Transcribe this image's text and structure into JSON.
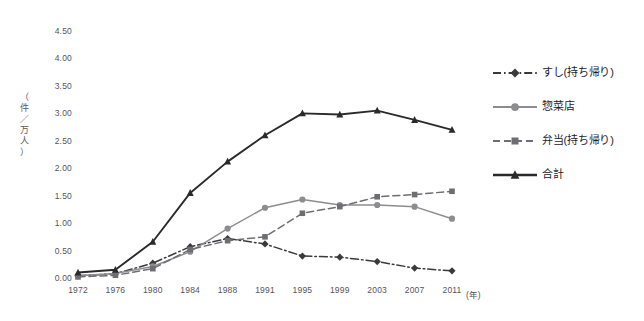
{
  "chart_data": {
    "type": "line",
    "title": "",
    "subtitle": "",
    "xlabel": "(年)",
    "ylabel": "（件／万人）",
    "ylabel_chars": [
      "（",
      "件",
      "／",
      "万",
      "人",
      "）"
    ],
    "categories": [
      "1972",
      "1976",
      "1980",
      "1984",
      "1988",
      "1991",
      "1995",
      "1999",
      "2003",
      "2007",
      "2011"
    ],
    "x": [
      1972,
      1976,
      1980,
      1984,
      1988,
      1991,
      1995,
      1999,
      2003,
      2007,
      2011
    ],
    "ylim": [
      0.0,
      4.5
    ],
    "ytick_labels": [
      "0.00",
      "0.50",
      "1.00",
      "1.50",
      "2.00",
      "2.50",
      "3.00",
      "3.50",
      "4.00",
      "4.50"
    ],
    "ytick_values": [
      0.0,
      0.5,
      1.0,
      1.5,
      2.0,
      2.5,
      3.0,
      3.5,
      4.0,
      4.5
    ],
    "grid": false,
    "legend_position": "right",
    "series": [
      {
        "name": "すし(持ち帰り)",
        "values": [
          0.04,
          0.08,
          0.27,
          0.57,
          0.72,
          0.62,
          0.4,
          0.38,
          0.3,
          0.18,
          0.13
        ],
        "color": "#3a3a3c",
        "line_style": "dashdot",
        "marker": "diamond"
      },
      {
        "name": "惣菜店",
        "values": [
          0.04,
          0.08,
          0.21,
          0.48,
          0.9,
          1.28,
          1.43,
          1.33,
          1.33,
          1.3,
          1.08
        ],
        "color": "#8d8d90",
        "line_style": "solid",
        "marker": "circle"
      },
      {
        "name": "弁当(持ち帰り)",
        "values": [
          0.02,
          0.05,
          0.17,
          0.52,
          0.68,
          0.75,
          1.18,
          1.3,
          1.48,
          1.52,
          1.58
        ],
        "color": "#6e6e72",
        "line_style": "dashed",
        "marker": "square"
      },
      {
        "name": "合計",
        "values": [
          0.1,
          0.15,
          0.66,
          1.55,
          2.12,
          2.6,
          3.0,
          2.98,
          3.05,
          2.88,
          2.7
        ],
        "color": "#2a2a2c",
        "line_style": "solid",
        "marker": "triangle"
      }
    ]
  },
  "legend": {
    "items": [
      {
        "label": "すし(持ち帰り)"
      },
      {
        "label": "惣菜店"
      },
      {
        "label": "弁当(持ち帰り)"
      },
      {
        "label": "合計"
      }
    ]
  }
}
